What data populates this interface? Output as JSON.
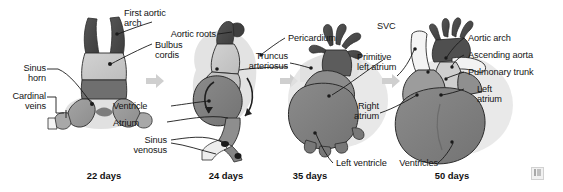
{
  "figure": {
    "background": "#ffffff"
  },
  "palette": {
    "outflow_dark": "#4a4a4a",
    "bulbus_light": "#c8c8c8",
    "ventricle_mid": "#7f7f7f",
    "atrium_gray": "#9a9a9a",
    "pericardium_halo": "#d8d8d8",
    "vessel_white": "#f2f2f2",
    "outline": "#2b2b2b",
    "leader_line": "#1a1a1a",
    "arrow_gray": "#cfcfcf",
    "text": "#141414"
  },
  "stages": [
    {
      "id": "stage-22-days",
      "label": "22 days"
    },
    {
      "id": "stage-24-days",
      "label": "24 days"
    },
    {
      "id": "stage-35-days",
      "label": "35 days"
    },
    {
      "id": "stage-50-days",
      "label": "50 days"
    }
  ],
  "labels": [
    {
      "id": "first-aortic-arch",
      "text": "First aortic\narch"
    },
    {
      "id": "bulbus-cordis",
      "text": "Bulbus\ncordis"
    },
    {
      "id": "sinus-horn",
      "text": "Sinus\nhorn"
    },
    {
      "id": "cardinal-veins",
      "text": "Cardinal\nveins"
    },
    {
      "id": "ventricle",
      "text": "Ventricle"
    },
    {
      "id": "atrium",
      "text": "Atrium"
    },
    {
      "id": "sinus-venosus",
      "text": "Sinus\nvenosus"
    },
    {
      "id": "aortic-roots",
      "text": "Aortic roots"
    },
    {
      "id": "pericardium",
      "text": "Pericardium"
    },
    {
      "id": "truncus-arteriosus",
      "text": "Truncus\narteriosus"
    },
    {
      "id": "primitive-left-atrium",
      "text": "Primitive\nleft atrium"
    },
    {
      "id": "left-ventricle",
      "text": "Left ventricle"
    },
    {
      "id": "svc",
      "text": "SVC"
    },
    {
      "id": "right-atrium",
      "text": "Right\natrium"
    },
    {
      "id": "aortic-arch",
      "text": "Aortic arch"
    },
    {
      "id": "ascending-aorta",
      "text": "Ascending aorta"
    },
    {
      "id": "pulmonary-trunk",
      "text": "Pulmonary trunk"
    },
    {
      "id": "left-atrium",
      "text": "Left\natrium"
    },
    {
      "id": "ventricles",
      "text": "Ventricles"
    }
  ],
  "arrows": [
    {
      "id": "arrow-22-to-24"
    },
    {
      "id": "arrow-24-to-35"
    },
    {
      "id": "arrow-35-to-50"
    }
  ],
  "watermark": {
    "id": "source-watermark"
  }
}
